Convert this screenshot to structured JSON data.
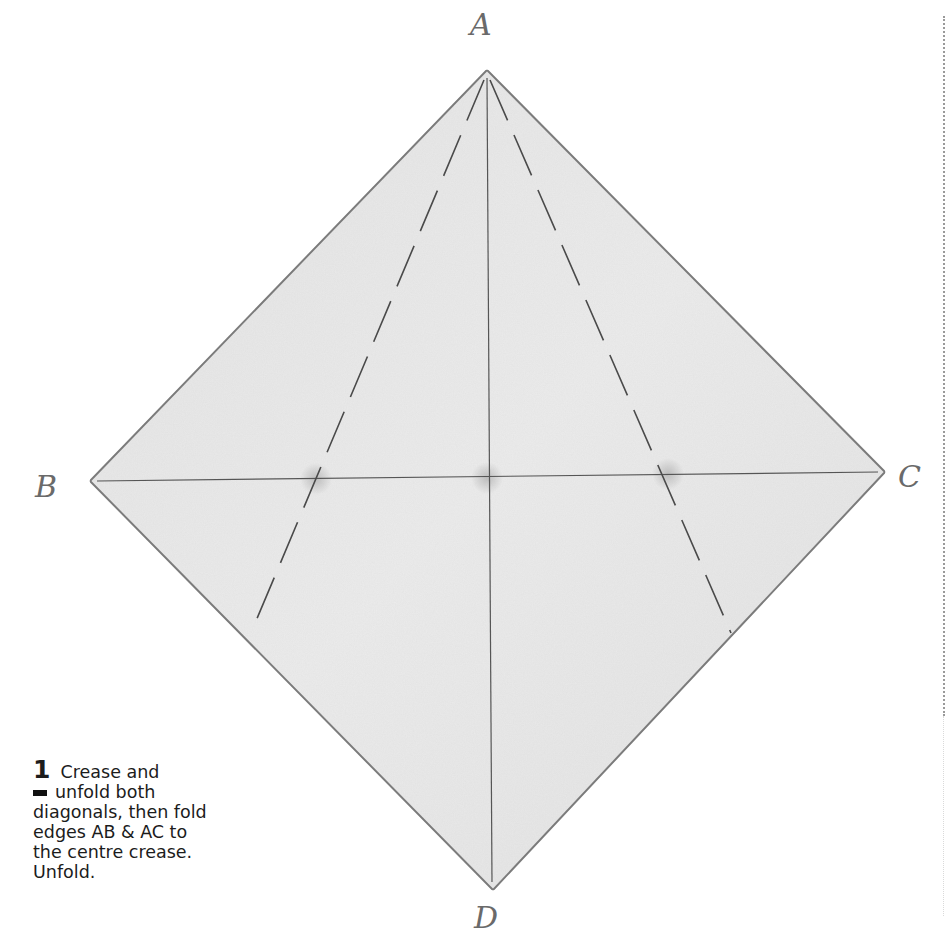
{
  "diagram": {
    "vertices": {
      "A": {
        "label": "A",
        "x": 487,
        "y": 70
      },
      "B": {
        "label": "B",
        "x": 90,
        "y": 481
      },
      "C": {
        "label": "C",
        "x": 885,
        "y": 472
      },
      "D": {
        "label": "D",
        "x": 493,
        "y": 890
      }
    },
    "label_positions": {
      "A": {
        "x": 470,
        "y": 35
      },
      "B": {
        "x": 35,
        "y": 497
      },
      "C": {
        "x": 898,
        "y": 487
      },
      "D": {
        "x": 474,
        "y": 928
      }
    },
    "creases": [
      {
        "name": "horizontal-diagonal-BC",
        "from": "B",
        "to": "C",
        "style": "solid"
      },
      {
        "name": "vertical-diagonal-AD",
        "from": "A",
        "to": "D",
        "style": "solid"
      }
    ],
    "fold_lines": [
      {
        "name": "fold-line-AB-to-centre",
        "x1": 484,
        "y1": 78,
        "x2": 253,
        "y2": 628,
        "style": "dashed"
      },
      {
        "name": "fold-line-AC-to-centre",
        "x1": 490,
        "y1": 78,
        "x2": 731,
        "y2": 633,
        "style": "dashed"
      }
    ],
    "intersection_marks": [
      {
        "x": 316,
        "y": 479
      },
      {
        "x": 487,
        "y": 478
      },
      {
        "x": 668,
        "y": 474
      }
    ],
    "colors": {
      "paper_fill": "#e6e6e6",
      "paper_edge": "#8a8a8a",
      "crease": "#555555",
      "fold_line": "#4a4a4a",
      "label": "#6a6a6a",
      "caption_text": "#1c1c1c"
    }
  },
  "caption": {
    "step_number": "1",
    "lines": [
      "Crease and",
      "unfold both",
      "diagonals, then fold",
      "edges AB & AC to",
      "the centre crease.",
      "Unfold."
    ]
  }
}
